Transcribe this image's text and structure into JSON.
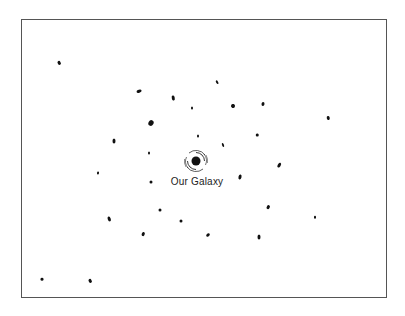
{
  "diagram": {
    "label": "Our Galaxy",
    "center": {
      "x": 196,
      "y": 161
    },
    "label_pos": {
      "x": 197,
      "y": 181
    },
    "frame": {
      "left": 21,
      "top": 19,
      "right": 388,
      "bottom": 299
    },
    "galaxies": [
      {
        "x": 59,
        "y": 63,
        "w": 2.5,
        "h": 4,
        "r": -30
      },
      {
        "x": 139,
        "y": 91,
        "w": 5,
        "h": 2.5,
        "r": -15
      },
      {
        "x": 173,
        "y": 98,
        "w": 2.5,
        "h": 5,
        "r": -10
      },
      {
        "x": 192,
        "y": 108,
        "w": 2,
        "h": 3,
        "r": 0
      },
      {
        "x": 151,
        "y": 123,
        "w": 5,
        "h": 6,
        "r": 30
      },
      {
        "x": 114,
        "y": 141,
        "w": 3,
        "h": 5,
        "r": 0
      },
      {
        "x": 198,
        "y": 136,
        "w": 2,
        "h": 3,
        "r": 0
      },
      {
        "x": 149,
        "y": 153,
        "w": 2,
        "h": 3,
        "r": 0
      },
      {
        "x": 217,
        "y": 82,
        "w": 2,
        "h": 3.5,
        "r": -30
      },
      {
        "x": 233,
        "y": 106,
        "w": 4,
        "h": 4,
        "r": 20
      },
      {
        "x": 263,
        "y": 104,
        "w": 3,
        "h": 4,
        "r": 10
      },
      {
        "x": 328,
        "y": 118,
        "w": 2.5,
        "h": 4,
        "r": -10
      },
      {
        "x": 257,
        "y": 135,
        "w": 2.5,
        "h": 3,
        "r": 0
      },
      {
        "x": 223,
        "y": 145,
        "w": 2,
        "h": 4,
        "r": -20
      },
      {
        "x": 98,
        "y": 173,
        "w": 2,
        "h": 3,
        "r": 10
      },
      {
        "x": 151,
        "y": 182,
        "w": 3,
        "h": 3,
        "r": 0
      },
      {
        "x": 160,
        "y": 210,
        "w": 3,
        "h": 3,
        "r": 0
      },
      {
        "x": 109,
        "y": 219,
        "w": 2.5,
        "h": 5,
        "r": -20
      },
      {
        "x": 181,
        "y": 221,
        "w": 3,
        "h": 3,
        "r": 0
      },
      {
        "x": 143,
        "y": 234,
        "w": 2.5,
        "h": 4,
        "r": 20
      },
      {
        "x": 42,
        "y": 279,
        "w": 3,
        "h": 2.5,
        "r": 0
      },
      {
        "x": 90,
        "y": 281,
        "w": 2.5,
        "h": 4,
        "r": -30
      },
      {
        "x": 279,
        "y": 165,
        "w": 2.5,
        "h": 5,
        "r": 30
      },
      {
        "x": 240,
        "y": 177,
        "w": 3,
        "h": 5,
        "r": 15
      },
      {
        "x": 268,
        "y": 207,
        "w": 2.5,
        "h": 4,
        "r": 30
      },
      {
        "x": 315,
        "y": 217,
        "w": 2,
        "h": 2.5,
        "r": 0
      },
      {
        "x": 208,
        "y": 235,
        "w": 3,
        "h": 4,
        "r": 45
      },
      {
        "x": 259,
        "y": 237,
        "w": 3,
        "h": 5,
        "r": 0
      }
    ]
  }
}
